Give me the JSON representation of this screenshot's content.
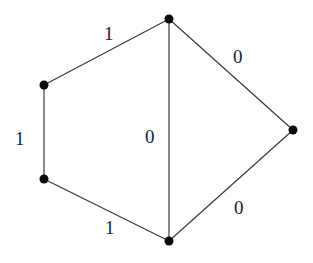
{
  "graph": {
    "nodes": [
      {
        "id": "top",
        "x": 169,
        "y": 19
      },
      {
        "id": "upper-left",
        "x": 44,
        "y": 85
      },
      {
        "id": "lower-left",
        "x": 44,
        "y": 179
      },
      {
        "id": "bottom",
        "x": 169,
        "y": 241
      },
      {
        "id": "right",
        "x": 293,
        "y": 130
      }
    ],
    "edges": [
      {
        "from": "upper-left",
        "to": "top",
        "weight": "1"
      },
      {
        "from": "top",
        "to": "right",
        "weight": "0"
      },
      {
        "from": "upper-left",
        "to": "lower-left",
        "weight": "1"
      },
      {
        "from": "top",
        "to": "bottom",
        "weight": "0"
      },
      {
        "from": "lower-left",
        "to": "bottom",
        "weight": "1"
      },
      {
        "from": "bottom",
        "to": "right",
        "weight": "0"
      }
    ],
    "labels": {
      "edge_top_left": "1",
      "edge_top_right": "0",
      "edge_left": "1",
      "edge_middle": "0",
      "edge_bottom_left": "1",
      "edge_bottom_right": "0"
    }
  }
}
